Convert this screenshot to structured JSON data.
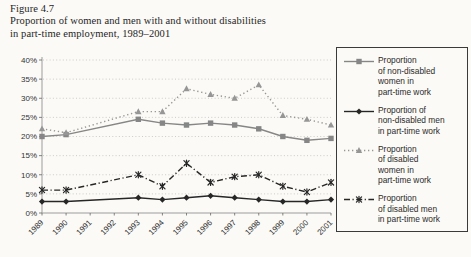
{
  "figure": {
    "label": "Figure 4.7",
    "title_line1": "Proportion of women and men with and without disabilities",
    "title_line2": "in part-time employment, 1989–2001"
  },
  "chart_data": {
    "type": "line",
    "title": "Proportion of women and men with and without disabilities in part-time employment, 1989–2001",
    "x_ticks": [
      1989,
      1990,
      1991,
      1992,
      1993,
      1994,
      1995,
      1996,
      1997,
      1998,
      1999,
      2000,
      2001
    ],
    "ylim": [
      0,
      40
    ],
    "y_tick_step": 5,
    "y_tick_suffix": "%",
    "grid": "horizontal-dotted",
    "legend_position": "right",
    "note": "no markers at 1991 and 1992; lines connect 1990 directly to 1993",
    "series": [
      {
        "name": "Proportion of non-disabled women in part-time work",
        "legend_lines": [
          "Proportion",
          "of non-disabled",
          "women in",
          "part-time work"
        ],
        "marker": "square",
        "line_style": "solid",
        "color": "#868686",
        "points": [
          [
            1989,
            20
          ],
          [
            1990,
            20.5
          ],
          [
            1993,
            24.5
          ],
          [
            1994,
            23.5
          ],
          [
            1995,
            23
          ],
          [
            1996,
            23.5
          ],
          [
            1997,
            23
          ],
          [
            1998,
            22
          ],
          [
            1999,
            20
          ],
          [
            2000,
            19
          ],
          [
            2001,
            19.5
          ]
        ]
      },
      {
        "name": "Proportion of non-disabled men in part-time work",
        "legend_lines": [
          "Proportion of",
          "non-disabled men",
          "in part-time work"
        ],
        "marker": "diamond",
        "line_style": "solid",
        "color": "#262626",
        "points": [
          [
            1989,
            3
          ],
          [
            1990,
            3
          ],
          [
            1993,
            4
          ],
          [
            1994,
            3.5
          ],
          [
            1995,
            4
          ],
          [
            1996,
            4.5
          ],
          [
            1997,
            4
          ],
          [
            1998,
            3.5
          ],
          [
            1999,
            3
          ],
          [
            2000,
            3
          ],
          [
            2001,
            3.5
          ]
        ]
      },
      {
        "name": "Proportion of disabled women in part-time work",
        "legend_lines": [
          "Proportion",
          "of disabled",
          "women in",
          "part-time work"
        ],
        "marker": "triangle",
        "line_style": "dotted",
        "color": "#969696",
        "points": [
          [
            1989,
            22
          ],
          [
            1990,
            21
          ],
          [
            1993,
            26.5
          ],
          [
            1994,
            26.5
          ],
          [
            1995,
            32.5
          ],
          [
            1996,
            31
          ],
          [
            1997,
            30
          ],
          [
            1998,
            33.5
          ],
          [
            1999,
            25.5
          ],
          [
            2000,
            24.5
          ],
          [
            2001,
            23
          ]
        ]
      },
      {
        "name": "Proportion of disabled men in part-time work",
        "legend_lines": [
          "Proportion",
          "of disabled men",
          "in part-time work"
        ],
        "marker": "asterisk",
        "line_style": "dash-dot",
        "color": "#262626",
        "points": [
          [
            1989,
            6
          ],
          [
            1990,
            6
          ],
          [
            1993,
            10
          ],
          [
            1994,
            7
          ],
          [
            1995,
            13
          ],
          [
            1996,
            8
          ],
          [
            1997,
            9.5
          ],
          [
            1998,
            10
          ],
          [
            1999,
            7
          ],
          [
            2000,
            5.5
          ],
          [
            2001,
            8
          ]
        ]
      }
    ]
  },
  "colors": {
    "background": "#fbfaf6",
    "grid": "#c6c6c6",
    "axis": "#9c9c9c",
    "tick": "#666666",
    "label_text": "#333333",
    "legend_border": "#3a3a3a"
  }
}
